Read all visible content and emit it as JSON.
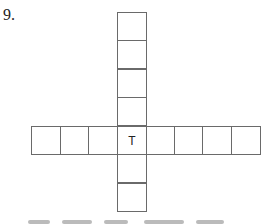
{
  "puzzle": {
    "number_label": "9.",
    "vertical_word": {
      "length": 7,
      "letters": [
        "",
        "",
        "",
        "",
        "T",
        "",
        ""
      ]
    },
    "horizontal_word": {
      "length": 8,
      "letters": [
        "",
        "",
        "",
        "T",
        "",
        "",
        "",
        ""
      ]
    },
    "intersection_letter": "T"
  }
}
